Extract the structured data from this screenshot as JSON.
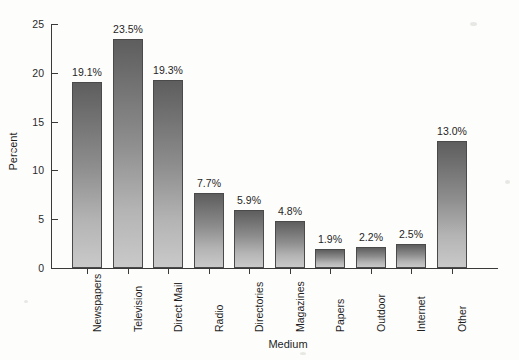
{
  "chart_data": {
    "type": "bar",
    "title": "",
    "xlabel": "Medium",
    "ylabel": "Percent",
    "categories": [
      "Newspapers",
      "Television",
      "Direct Mail",
      "Radio",
      "Directories",
      "Magazines",
      "Papers",
      "Outdoor",
      "Internet",
      "Other"
    ],
    "values": [
      19.1,
      23.5,
      19.3,
      7.7,
      5.9,
      4.8,
      1.9,
      2.2,
      2.5,
      13.0
    ],
    "data_labels": [
      "19.1%",
      "23.5%",
      "19.3%",
      "7.7%",
      "5.9%",
      "4.8%",
      "1.9%",
      "2.2%",
      "2.5%",
      "13.0%"
    ],
    "ylim": [
      0,
      25
    ],
    "yticks": [
      0,
      5,
      10,
      15,
      20,
      25
    ],
    "ytick_labels": [
      "0",
      "5",
      "10",
      "15",
      "20",
      "25"
    ],
    "grid": false,
    "legend": "none",
    "bar_color_top": "#5e5e5e",
    "bar_color_bottom": "#c9c9c9",
    "bar_border_color": "#4a4a4a",
    "axis_color": "#3a3a3a",
    "background": "#fdfdfc"
  }
}
